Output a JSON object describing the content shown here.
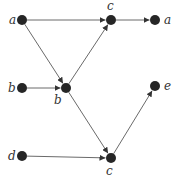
{
  "diagram": {
    "type": "directed-graph",
    "colors": {
      "node": "#262626",
      "edge": "#6a6a6a",
      "label": "#333333",
      "background": "#ffffff"
    },
    "nodes": [
      {
        "id": "n1",
        "label": "a",
        "x": 22,
        "y": 20,
        "lx": 9,
        "ly": 24
      },
      {
        "id": "n2",
        "label": "c",
        "x": 111,
        "y": 20,
        "lx": 107,
        "ly": 10
      },
      {
        "id": "n3",
        "label": "a",
        "x": 155,
        "y": 20,
        "lx": 164,
        "ly": 24
      },
      {
        "id": "n4",
        "label": "b",
        "x": 22,
        "y": 88,
        "lx": 8,
        "ly": 92
      },
      {
        "id": "n5",
        "label": "b",
        "x": 66,
        "y": 88,
        "lx": 54,
        "ly": 104
      },
      {
        "id": "n6",
        "label": "e",
        "x": 155,
        "y": 86,
        "lx": 164,
        "ly": 90
      },
      {
        "id": "n7",
        "label": "d",
        "x": 22,
        "y": 156,
        "lx": 8,
        "ly": 160
      },
      {
        "id": "n8",
        "label": "c",
        "x": 111,
        "y": 158,
        "lx": 106,
        "ly": 175
      }
    ],
    "edges": [
      {
        "from": "n1",
        "to": "n2"
      },
      {
        "from": "n2",
        "to": "n3"
      },
      {
        "from": "n1",
        "to": "n5"
      },
      {
        "from": "n4",
        "to": "n5"
      },
      {
        "from": "n5",
        "to": "n2"
      },
      {
        "from": "n5",
        "to": "n8"
      },
      {
        "from": "n7",
        "to": "n8"
      },
      {
        "from": "n8",
        "to": "n6"
      }
    ]
  }
}
